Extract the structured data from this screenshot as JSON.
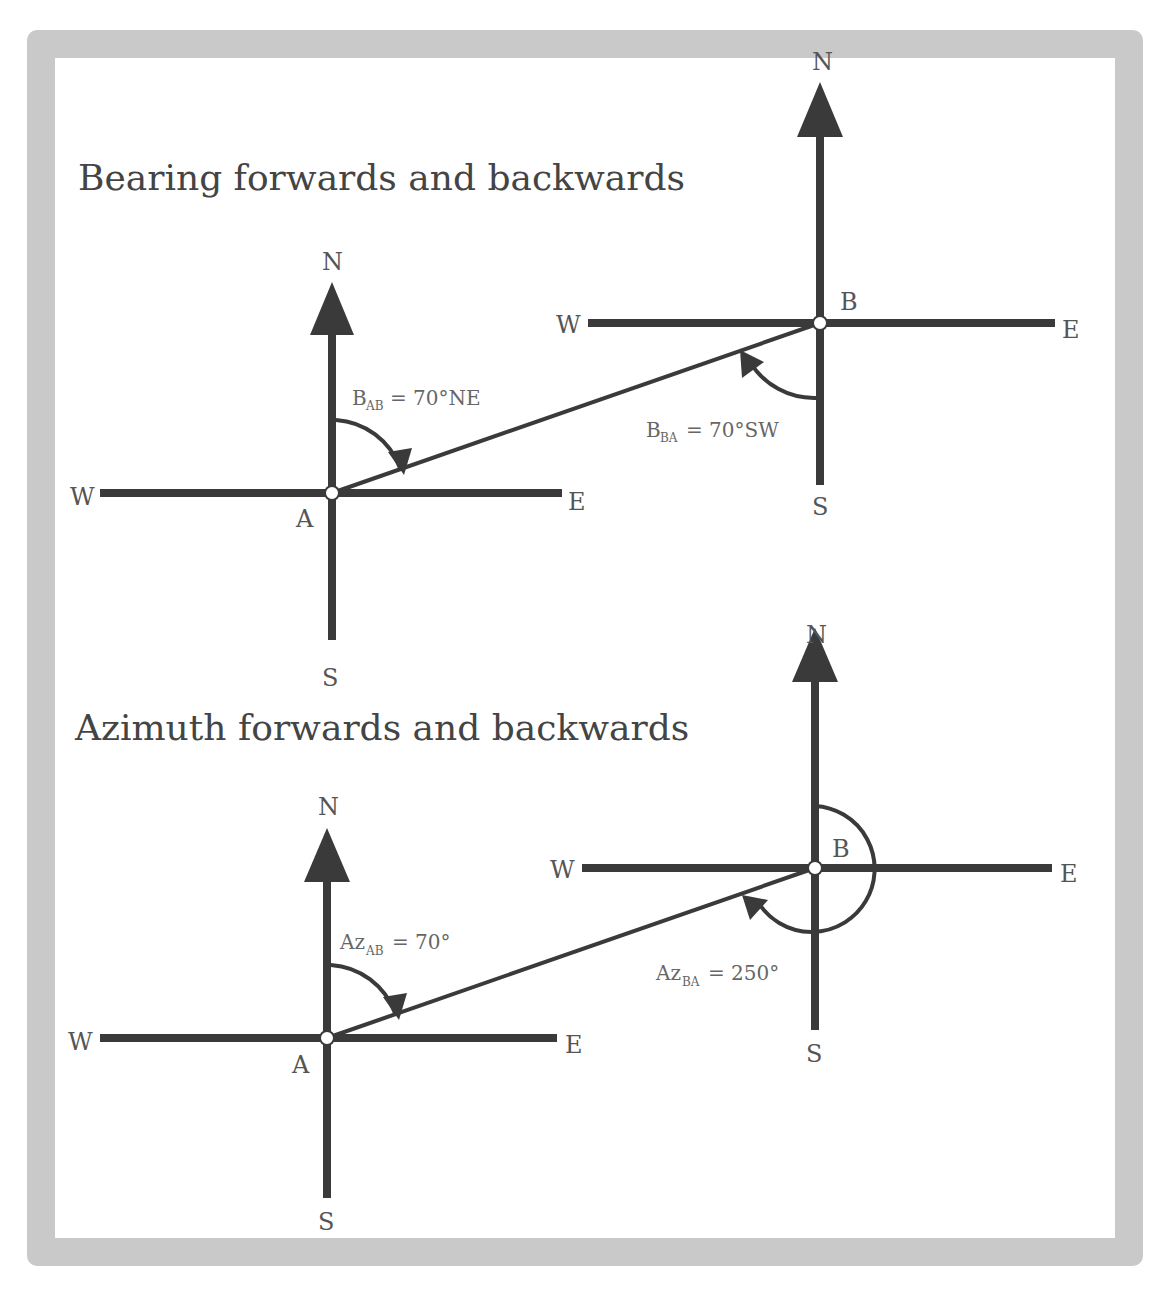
{
  "colors": {
    "frame": "#c9c9c9",
    "line": "#3a3a3a",
    "text": "#555555",
    "background": "#ffffff"
  },
  "panels": [
    {
      "id": "bearing",
      "title": "Bearing forwards and backwards",
      "station_a": {
        "label": "A",
        "N": "N",
        "S": "S",
        "E": "E",
        "W": "W"
      },
      "station_b": {
        "label": "B",
        "N": "N",
        "S": "S",
        "E": "E",
        "W": "W"
      },
      "forward": {
        "symbol": "B",
        "subscript": "AB",
        "value": "= 70°NE",
        "degrees": 70,
        "quadrant": "NE"
      },
      "backward": {
        "symbol": "B",
        "subscript": "BA",
        "value": "= 70°SW",
        "degrees": 70,
        "quadrant": "SW"
      }
    },
    {
      "id": "azimuth",
      "title": "Azimuth forwards and backwards",
      "station_a": {
        "label": "A",
        "N": "N",
        "S": "S",
        "E": "E",
        "W": "W"
      },
      "station_b": {
        "label": "B",
        "N": "N",
        "S": "S",
        "E": "E",
        "W": "W"
      },
      "forward": {
        "symbol": "Az",
        "subscript": "AB",
        "value": "= 70°",
        "degrees": 70
      },
      "backward": {
        "symbol": "Az",
        "subscript": "BA",
        "value": "= 250°",
        "degrees": 250
      }
    }
  ]
}
